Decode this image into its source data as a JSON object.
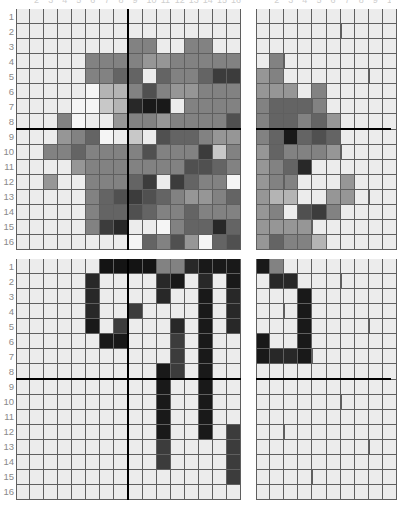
{
  "figure": {
    "kind": "pixel-grid-heatmap-quadrants",
    "background": "#ffffff",
    "gridline_color": "#5f5f5f",
    "divider_color": "#000000",
    "row_labels": [
      "1",
      "2",
      "3",
      "4",
      "5",
      "6",
      "7",
      "8",
      "9",
      "10",
      "11",
      "12",
      "13",
      "14",
      "15",
      "16"
    ],
    "clipped_top_column_labels": [
      "2",
      "3",
      "4",
      "5",
      "6",
      "7",
      "8",
      "9",
      "10",
      "11",
      "12",
      "13",
      "14",
      "15",
      "16",
      "2",
      "3",
      "4",
      "5",
      "6",
      "7",
      "8",
      "9"
    ],
    "divider_after_row": 8,
    "divider_after_col": 8
  },
  "chart_data": {
    "type": "heatmap",
    "title": "",
    "subtitle": "",
    "xlabel": "",
    "ylabel": "",
    "grid": true,
    "legend": "none",
    "value_scale": "grayscale 0 (black) to 255 (white)",
    "rows": 16,
    "cols": 16,
    "row_tick_labels": [
      "1",
      "2",
      "3",
      "4",
      "5",
      "6",
      "7",
      "8",
      "9",
      "10",
      "11",
      "12",
      "13",
      "14",
      "15",
      "16"
    ],
    "panels": [
      {
        "name": "top-left",
        "position": "upper-left",
        "cols_visible": 16,
        "rows_visible": 16,
        "grid": [
          [
            236,
            236,
            236,
            236,
            236,
            236,
            236,
            236,
            236,
            236,
            236,
            236,
            236,
            236,
            236,
            236
          ],
          [
            236,
            236,
            236,
            236,
            236,
            236,
            236,
            236,
            236,
            236,
            236,
            236,
            236,
            236,
            236,
            236
          ],
          [
            236,
            236,
            236,
            236,
            236,
            236,
            236,
            236,
            130,
            130,
            236,
            236,
            130,
            130,
            236,
            236
          ],
          [
            236,
            236,
            236,
            236,
            236,
            130,
            130,
            130,
            130,
            150,
            150,
            130,
            130,
            130,
            130,
            130
          ],
          [
            236,
            236,
            236,
            236,
            236,
            130,
            130,
            100,
            100,
            236,
            100,
            130,
            130,
            100,
            60,
            60
          ],
          [
            236,
            236,
            236,
            236,
            236,
            245,
            180,
            180,
            130,
            80,
            130,
            150,
            150,
            130,
            130,
            130
          ],
          [
            236,
            236,
            236,
            236,
            245,
            245,
            200,
            180,
            40,
            25,
            25,
            236,
            130,
            130,
            130,
            130
          ],
          [
            236,
            236,
            236,
            130,
            245,
            236,
            236,
            150,
            130,
            130,
            150,
            130,
            130,
            130,
            130,
            80
          ],
          [
            236,
            236,
            236,
            150,
            130,
            100,
            245,
            236,
            200,
            236,
            80,
            100,
            100,
            130,
            150,
            150
          ],
          [
            236,
            236,
            130,
            130,
            100,
            130,
            130,
            130,
            130,
            80,
            130,
            130,
            130,
            60,
            200,
            130
          ],
          [
            236,
            236,
            236,
            236,
            150,
            130,
            130,
            130,
            130,
            130,
            130,
            130,
            80,
            80,
            100,
            130
          ],
          [
            236,
            236,
            150,
            236,
            236,
            130,
            130,
            130,
            100,
            60,
            236,
            60,
            100,
            130,
            130,
            245
          ],
          [
            236,
            236,
            236,
            236,
            236,
            130,
            100,
            80,
            60,
            80,
            100,
            130,
            150,
            150,
            130,
            100
          ],
          [
            236,
            236,
            236,
            236,
            236,
            130,
            100,
            100,
            80,
            100,
            130,
            130,
            100,
            130,
            130,
            130
          ],
          [
            236,
            236,
            236,
            236,
            236,
            130,
            60,
            40,
            236,
            236,
            245,
            130,
            100,
            100,
            40,
            100
          ],
          [
            236,
            236,
            236,
            236,
            236,
            236,
            236,
            236,
            245,
            100,
            130,
            80,
            150,
            245,
            100,
            80
          ]
        ]
      },
      {
        "name": "top-right",
        "position": "upper-right",
        "cols_visible": 10,
        "rows_visible": 16,
        "clipped_right": true,
        "grid": [
          [
            236,
            236,
            236,
            236,
            236,
            236,
            236,
            236,
            236,
            236
          ],
          [
            236,
            236,
            236,
            236,
            236,
            236,
            236,
            236,
            236,
            236
          ],
          [
            236,
            236,
            236,
            236,
            236,
            236,
            236,
            236,
            236,
            236
          ],
          [
            236,
            130,
            236,
            236,
            236,
            236,
            236,
            236,
            236,
            236
          ],
          [
            150,
            130,
            236,
            236,
            236,
            236,
            236,
            236,
            236,
            236
          ],
          [
            150,
            150,
            150,
            236,
            130,
            236,
            236,
            236,
            236,
            236
          ],
          [
            130,
            100,
            100,
            100,
            130,
            236,
            236,
            236,
            236,
            236
          ],
          [
            130,
            100,
            100,
            130,
            100,
            150,
            236,
            236,
            236,
            236
          ],
          [
            130,
            100,
            25,
            100,
            80,
            100,
            236,
            236,
            236,
            236
          ],
          [
            150,
            100,
            130,
            130,
            130,
            150,
            236,
            236,
            236,
            236
          ],
          [
            150,
            130,
            100,
            40,
            236,
            236,
            236,
            236,
            236,
            236
          ],
          [
            150,
            130,
            130,
            236,
            236,
            236,
            150,
            236,
            236,
            236
          ],
          [
            150,
            180,
            180,
            236,
            236,
            150,
            150,
            236,
            236,
            236
          ],
          [
            150,
            130,
            236,
            80,
            60,
            130,
            236,
            236,
            236,
            236
          ],
          [
            150,
            150,
            150,
            150,
            236,
            236,
            236,
            236,
            236,
            236
          ],
          [
            150,
            100,
            130,
            130,
            180,
            236,
            236,
            236,
            236,
            236
          ]
        ]
      },
      {
        "name": "bottom-left",
        "position": "lower-left",
        "cols_visible": 16,
        "rows_visible": 16,
        "grid": [
          [
            236,
            236,
            236,
            236,
            236,
            236,
            20,
            20,
            20,
            20,
            130,
            130,
            40,
            25,
            25,
            25
          ],
          [
            236,
            236,
            236,
            236,
            236,
            40,
            236,
            236,
            236,
            236,
            40,
            25,
            236,
            40,
            236,
            25
          ],
          [
            236,
            236,
            236,
            236,
            236,
            40,
            236,
            236,
            236,
            236,
            40,
            236,
            236,
            25,
            236,
            40
          ],
          [
            236,
            236,
            236,
            236,
            236,
            40,
            236,
            236,
            60,
            236,
            236,
            236,
            236,
            25,
            236,
            40
          ],
          [
            236,
            236,
            236,
            236,
            236,
            25,
            236,
            60,
            236,
            236,
            236,
            40,
            236,
            25,
            236,
            40
          ],
          [
            236,
            236,
            236,
            236,
            236,
            236,
            25,
            25,
            236,
            236,
            236,
            60,
            236,
            25,
            236,
            236
          ],
          [
            236,
            236,
            236,
            236,
            236,
            236,
            236,
            236,
            236,
            236,
            236,
            60,
            236,
            25,
            236,
            236
          ],
          [
            236,
            236,
            236,
            236,
            236,
            236,
            236,
            236,
            236,
            236,
            25,
            60,
            236,
            25,
            236,
            236
          ],
          [
            236,
            236,
            236,
            236,
            236,
            236,
            236,
            236,
            236,
            236,
            25,
            236,
            236,
            25,
            236,
            236
          ],
          [
            236,
            236,
            236,
            236,
            236,
            236,
            236,
            236,
            236,
            236,
            25,
            236,
            236,
            25,
            236,
            236
          ],
          [
            236,
            236,
            236,
            236,
            236,
            236,
            236,
            236,
            236,
            236,
            25,
            236,
            236,
            25,
            236,
            236
          ],
          [
            236,
            236,
            236,
            236,
            236,
            236,
            236,
            236,
            236,
            236,
            25,
            236,
            236,
            25,
            236,
            60
          ],
          [
            236,
            236,
            236,
            236,
            236,
            236,
            236,
            236,
            236,
            236,
            60,
            236,
            236,
            236,
            236,
            60
          ],
          [
            236,
            236,
            236,
            236,
            236,
            236,
            236,
            236,
            236,
            236,
            60,
            236,
            236,
            236,
            236,
            60
          ],
          [
            236,
            236,
            236,
            236,
            236,
            236,
            236,
            236,
            236,
            236,
            236,
            236,
            236,
            236,
            236,
            60
          ],
          [
            236,
            236,
            236,
            236,
            236,
            236,
            236,
            236,
            236,
            236,
            236,
            236,
            236,
            236,
            236,
            236
          ]
        ]
      },
      {
        "name": "bottom-right",
        "position": "lower-right",
        "cols_visible": 10,
        "rows_visible": 16,
        "clipped_right": true,
        "grid": [
          [
            25,
            130,
            236,
            236,
            236,
            236,
            236,
            236,
            236,
            236
          ],
          [
            236,
            40,
            40,
            236,
            236,
            236,
            236,
            236,
            236,
            236
          ],
          [
            236,
            236,
            236,
            25,
            236,
            236,
            236,
            236,
            236,
            236
          ],
          [
            236,
            236,
            236,
            25,
            236,
            236,
            236,
            236,
            236,
            236
          ],
          [
            236,
            236,
            236,
            25,
            236,
            236,
            236,
            236,
            236,
            236
          ],
          [
            25,
            236,
            236,
            25,
            236,
            236,
            236,
            236,
            236,
            236
          ],
          [
            25,
            40,
            40,
            25,
            236,
            236,
            236,
            236,
            236,
            236
          ],
          [
            236,
            236,
            236,
            236,
            236,
            236,
            236,
            236,
            236,
            236
          ],
          [
            236,
            236,
            236,
            236,
            236,
            236,
            236,
            236,
            236,
            236
          ],
          [
            236,
            236,
            236,
            236,
            236,
            236,
            236,
            236,
            236,
            236
          ],
          [
            236,
            236,
            236,
            236,
            236,
            236,
            236,
            236,
            236,
            236
          ],
          [
            236,
            236,
            236,
            236,
            236,
            236,
            236,
            236,
            236,
            236
          ],
          [
            236,
            236,
            236,
            236,
            236,
            236,
            236,
            236,
            236,
            236
          ],
          [
            236,
            236,
            236,
            236,
            236,
            236,
            236,
            236,
            236,
            236
          ],
          [
            236,
            236,
            236,
            236,
            236,
            236,
            236,
            236,
            236,
            236
          ],
          [
            236,
            236,
            236,
            236,
            236,
            236,
            236,
            236,
            236,
            236
          ]
        ]
      }
    ]
  }
}
